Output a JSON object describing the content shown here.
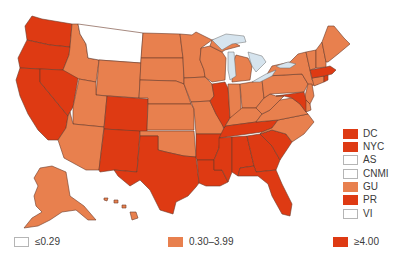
{
  "colors": {
    "low": "#ffffff",
    "mid": "#e8804e",
    "high": "#de3a13",
    "border": "#6b3a2a",
    "lake": "#d6e4ee"
  },
  "map": {
    "title": "United States choropleth map",
    "states": {
      "WA": "high",
      "OR": "high",
      "CA": "high",
      "NV": "high",
      "ID": "mid",
      "MT": "low",
      "WY": "mid",
      "UT": "mid",
      "AZ": "mid",
      "CO": "high",
      "NM": "high",
      "ND": "mid",
      "SD": "mid",
      "NE": "mid",
      "KS": "mid",
      "OK": "mid",
      "TX": "high",
      "MN": "mid",
      "IA": "mid",
      "MO": "mid",
      "AR": "high",
      "LA": "high",
      "WI": "mid",
      "IL": "high",
      "MI": "mid",
      "IN": "mid",
      "OH": "mid",
      "KY": "mid",
      "TN": "high",
      "MS": "high",
      "AL": "high",
      "GA": "high",
      "FL": "high",
      "SC": "high",
      "NC": "mid",
      "VA": "mid",
      "WV": "mid",
      "PA": "mid",
      "NY": "mid",
      "NJ": "mid",
      "DE": "mid",
      "MD": "high",
      "CT": "mid",
      "RI": "high",
      "MA": "high",
      "VT": "mid",
      "NH": "mid",
      "ME": "mid",
      "AK": "mid",
      "HI": "mid"
    }
  },
  "territory_legend": [
    {
      "label": "DC",
      "level": "high"
    },
    {
      "label": "NYC",
      "level": "high"
    },
    {
      "label": "AS",
      "level": "low"
    },
    {
      "label": "CNMI",
      "level": "low"
    },
    {
      "label": "GU",
      "level": "mid"
    },
    {
      "label": "PR",
      "level": "high"
    },
    {
      "label": "VI",
      "level": "low"
    }
  ],
  "legend": {
    "low": {
      "label": "≤0.29"
    },
    "mid": {
      "label": "0.30–3.99"
    },
    "high": {
      "label": "≥4.00"
    }
  }
}
